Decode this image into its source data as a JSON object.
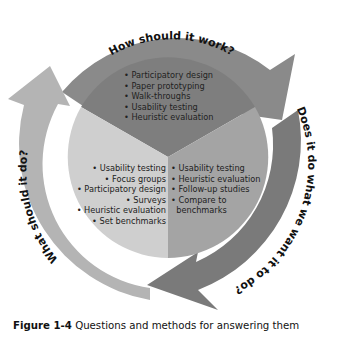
{
  "diagram": {
    "type": "cycle",
    "ring_questions": [
      {
        "label": "How should it work?",
        "position": "top",
        "color": "#8a8a8a"
      },
      {
        "label": "Does it do what we want it to do?",
        "position": "right-bottom",
        "color": "#7a7a7a"
      },
      {
        "label": "What should it do?",
        "position": "left",
        "color": "#b4b4b4"
      }
    ],
    "sectors": [
      {
        "name": "how-should-it-work",
        "color": "#7e7e7e",
        "items": [
          "• Participatory design",
          "• Paper prototyping",
          "• Walk-throughs",
          "• Usability testing",
          "• Heuristic evaluation"
        ]
      },
      {
        "name": "what-should-it-do",
        "color": "#cfcfcf",
        "items": [
          "• Usability testing",
          "• Focus groups",
          "• Participatory design",
          "• Surveys",
          "• Heuristic evaluation",
          "• Set benchmarks"
        ]
      },
      {
        "name": "does-it-do-what-we-want",
        "color": "#a4a4a4",
        "items": [
          "• Usability testing",
          "• Heuristic evaluation",
          "• Follow-up studies",
          "• Compare to",
          "  benchmarks"
        ]
      }
    ]
  },
  "caption": {
    "label": "Figure 1-4",
    "text": " Questions and methods for answering them"
  }
}
